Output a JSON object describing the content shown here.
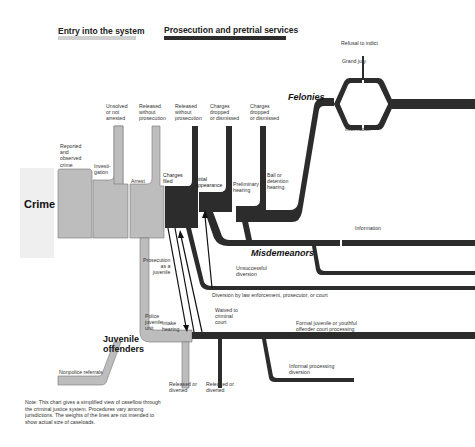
{
  "colors": {
    "entry": "#bdbdbd",
    "prosecution": "#2c2c2c",
    "background_band": "#efefef",
    "outline": "#555555"
  },
  "legend": {
    "entry": "Entry into the system",
    "prosecution": "Prosecution and pretrial services"
  },
  "main": {
    "crime": "Crime",
    "juvenile_offenders": "Juvenile\noffenders",
    "felonies": "Felonies",
    "misdemeanors": "Misdemeanors"
  },
  "stages": {
    "reported": "Reported\nand\nobserved\ncrime",
    "investigation": "Investi-\ngation",
    "arrest": "Arrest",
    "charges_filed": "Charges\nfiled",
    "initial_appearance": "Initial\nappearance",
    "preliminary_hearing": "Preliminary\nhearing",
    "bail_hearing": "Bail or\ndetention\nhearing",
    "grand_jury": "Grand jury",
    "refusal_to_indict": "Refusal to indict",
    "information_felony": "Information",
    "information_misdemeanor": "Information",
    "police_juvenile_unit": "Police\njuvenile\nunit",
    "intake_hearing": "Intake\nhearing",
    "nonpolice_referrals": "Nonpolice referrals"
  },
  "exits": {
    "unsolved": "Unsolved\nor not\narrested",
    "released_1": "Released\nwithout\nprosecution",
    "released_2": "Released\nwithout\nprosecution",
    "dropped_1": "Charges\ndropped\nor dismissed",
    "dropped_2": "Charges\ndropped\nor dismissed",
    "unsuccessful_diversion": "Unsuccessful\ndiversion",
    "diversion": "Diversion by law enforcement, prosecutor, or court",
    "prosecution_as_juvenile": "Prosecution\nas a\njuvenile",
    "waived": "Waived to\ncriminal\ncourt",
    "formal_juvenile": "Formal juvenile or youthful\noffender court processing",
    "informal": "Informal processing\ndiversion",
    "released_diverted_1": "Released or\ndiverted",
    "released_diverted_2": "Released or\ndiverted"
  },
  "note": "Note: This chart gives a simplified view of caseflow through the criminal justice system. Procedures vary among jurisdictions. The weights of the lines are not intended to show actual size of caseloads."
}
